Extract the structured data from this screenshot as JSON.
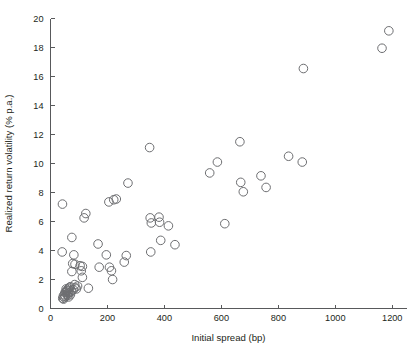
{
  "chart_data": {
    "type": "scatter",
    "title": "",
    "xlabel": "Initial spread (bp)",
    "ylabel": "Realized return volatility (% p.a.)",
    "xlim": [
      0,
      1250
    ],
    "ylim": [
      0,
      20
    ],
    "xticks": [
      0,
      200,
      400,
      600,
      800,
      1000,
      1200
    ],
    "xtick_labels": [
      "0",
      "200",
      "400",
      "600",
      "800",
      "1000",
      "1200"
    ],
    "yticks": [
      0,
      2,
      4,
      6,
      8,
      10,
      12,
      14,
      16,
      18,
      20
    ],
    "ytick_labels": [
      "0",
      "2",
      "4",
      "6",
      "8",
      "10",
      "12",
      "14",
      "16",
      "18",
      "20"
    ],
    "grid": false,
    "legend": null,
    "marker": {
      "shape": "circle-open",
      "edge_color": "#6d6e71",
      "fill": "none",
      "size_px": 4.6
    },
    "axis_color": "#58595b",
    "background_color": "#ffffff",
    "points": [
      [
        42,
        7.2
      ],
      [
        41,
        3.9
      ],
      [
        75,
        4.9
      ],
      [
        82,
        3.7
      ],
      [
        78,
        3.1
      ],
      [
        86,
        3.05
      ],
      [
        75,
        2.55
      ],
      [
        104,
        2.95
      ],
      [
        112,
        2.9
      ],
      [
        108,
        2.6
      ],
      [
        112,
        2.15
      ],
      [
        118,
        6.25
      ],
      [
        124,
        6.55
      ],
      [
        133,
        1.4
      ],
      [
        85,
        1.65
      ],
      [
        95,
        1.55
      ],
      [
        70,
        1.5
      ],
      [
        66,
        1.45
      ],
      [
        62,
        1.35
      ],
      [
        58,
        1.25
      ],
      [
        54,
        1.15
      ],
      [
        57,
        1.0
      ],
      [
        60,
        0.9
      ],
      [
        52,
        0.85
      ],
      [
        49,
        0.75
      ],
      [
        46,
        0.65
      ],
      [
        64,
        0.8
      ],
      [
        70,
        0.95
      ],
      [
        74,
        1.2
      ],
      [
        80,
        1.3
      ],
      [
        86,
        1.45
      ],
      [
        91,
        1.35
      ],
      [
        68,
        1.1
      ],
      [
        63,
        1.05
      ],
      [
        59,
        1.2
      ],
      [
        55,
        1.35
      ],
      [
        51,
        1.1
      ],
      [
        48,
        0.95
      ],
      [
        45,
        0.85
      ],
      [
        43,
        0.7
      ],
      [
        167,
        4.45
      ],
      [
        171,
        2.85
      ],
      [
        196,
        3.7
      ],
      [
        207,
        2.85
      ],
      [
        214,
        2.6
      ],
      [
        218,
        2.0
      ],
      [
        205,
        7.35
      ],
      [
        222,
        7.5
      ],
      [
        231,
        7.55
      ],
      [
        259,
        3.2
      ],
      [
        266,
        3.65
      ],
      [
        272,
        8.65
      ],
      [
        348,
        11.1
      ],
      [
        350,
        6.25
      ],
      [
        354,
        5.9
      ],
      [
        352,
        3.9
      ],
      [
        381,
        6.3
      ],
      [
        383,
        5.95
      ],
      [
        387,
        4.7
      ],
      [
        414,
        5.7
      ],
      [
        437,
        4.4
      ],
      [
        559,
        9.35
      ],
      [
        586,
        10.1
      ],
      [
        612,
        5.85
      ],
      [
        665,
        11.5
      ],
      [
        668,
        8.7
      ],
      [
        677,
        8.05
      ],
      [
        739,
        9.15
      ],
      [
        757,
        8.35
      ],
      [
        836,
        10.5
      ],
      [
        884,
        10.1
      ],
      [
        888,
        16.55
      ],
      [
        1164,
        17.95
      ],
      [
        1188,
        19.15
      ]
    ]
  }
}
